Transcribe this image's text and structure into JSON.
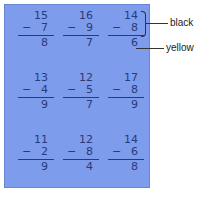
{
  "problems": [
    {
      "top": "15",
      "op": "−",
      "sub": "7",
      "ans": "8"
    },
    {
      "top": "16",
      "op": "−",
      "sub": "9",
      "ans": "7"
    },
    {
      "top": "14",
      "op": "−",
      "sub": "8",
      "ans": "6"
    },
    {
      "top": "13",
      "op": "−",
      "sub": "4",
      "ans": "9"
    },
    {
      "top": "12",
      "op": "−",
      "sub": "5",
      "ans": "7"
    },
    {
      "top": "17",
      "op": "−",
      "sub": "8",
      "ans": "9"
    },
    {
      "top": "11",
      "op": "−",
      "sub": "2",
      "ans": "9"
    },
    {
      "top": "12",
      "op": "−",
      "sub": "8",
      "ans": "4"
    },
    {
      "top": "14",
      "op": "−",
      "sub": "6",
      "ans": "8"
    }
  ],
  "labels": {
    "black": "black",
    "yellow": "yellow"
  },
  "colors": {
    "panel": "#7d9cec",
    "ink": "#2a3a7a"
  }
}
